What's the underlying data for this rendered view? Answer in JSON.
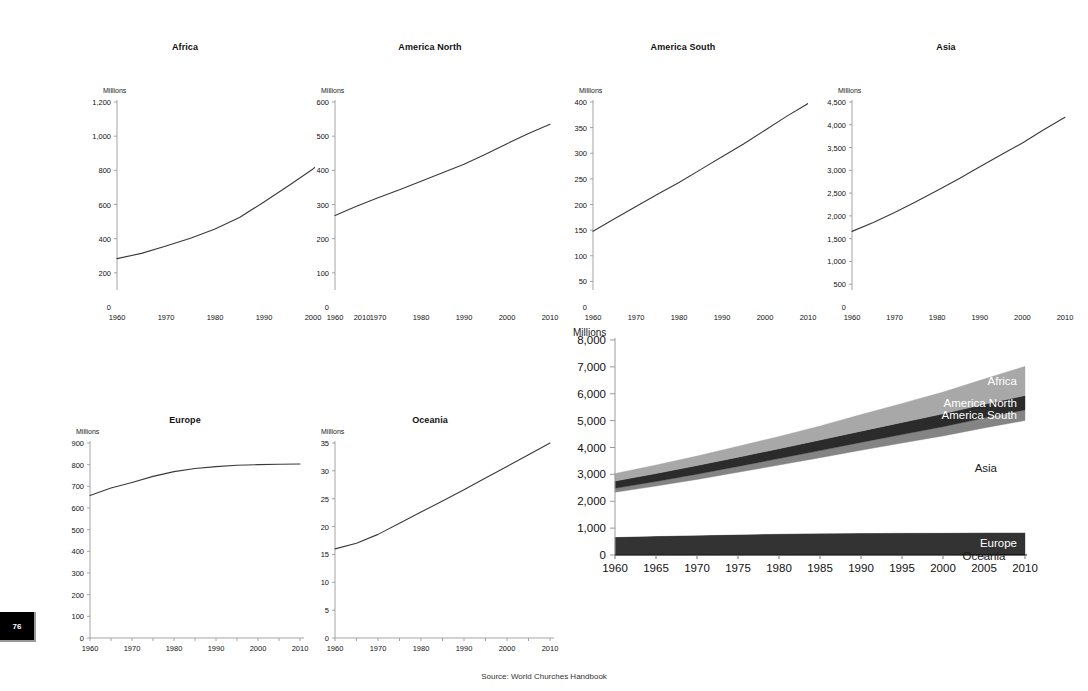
{
  "page_number": "76",
  "source_note": "Source: World Churches Handbook",
  "axis_unit_label": "Millions",
  "colors": {
    "line": "#3a3a3a",
    "axis": "#9a9a9a",
    "africa": "#a8a8a8",
    "america_north": "#2b2b2b",
    "america_south": "#848484",
    "asia": "#ffffff",
    "europe": "#333333",
    "oceania": "#1a1a1a",
    "text": "#1a1a1a"
  },
  "chart_data": [
    {
      "type": "line",
      "title": "Africa",
      "ylabel": "Millions",
      "xlabel": "",
      "x": [
        1960,
        1965,
        1970,
        1975,
        1980,
        1985,
        1990,
        1995,
        2000,
        2005,
        2010
      ],
      "values": [
        283,
        314,
        357,
        403,
        456,
        524,
        615,
        710,
        808,
        940,
        1085
      ],
      "ylim": [
        0,
        1200
      ],
      "yticks": [
        0,
        200,
        400,
        600,
        800,
        1000,
        1200
      ],
      "ytick_labels": [
        "0",
        "200",
        "400",
        "600",
        "800",
        "1,000",
        "1,200"
      ],
      "xlim": [
        1960,
        2010
      ],
      "xticks": [
        1960,
        1970,
        1980,
        1990,
        2000,
        2010
      ],
      "xtick_labels": [
        "1960",
        "1970",
        "1980",
        "1990",
        "2000",
        "2010"
      ],
      "xminor_step": 5,
      "grid": false
    },
    {
      "type": "line",
      "title": "America North",
      "ylabel": "Millions",
      "xlabel": "",
      "x": [
        1960,
        1965,
        1970,
        1975,
        1980,
        1985,
        1990,
        1995,
        2000,
        2005,
        2010
      ],
      "values": [
        268,
        295,
        320,
        343,
        368,
        393,
        418,
        447,
        478,
        508,
        535
      ],
      "ylim": [
        0,
        600
      ],
      "yticks": [
        0,
        100,
        200,
        300,
        400,
        500,
        600
      ],
      "ytick_labels": [
        "0",
        "100",
        "200",
        "300",
        "400",
        "500",
        "600"
      ],
      "xlim": [
        1960,
        2010
      ],
      "xticks": [
        1960,
        1970,
        1980,
        1990,
        2000,
        2010
      ],
      "xtick_labels": [
        "1960",
        "1970",
        "1980",
        "1990",
        "2000",
        "2010"
      ],
      "xminor_step": 5,
      "grid": false
    },
    {
      "type": "line",
      "title": "America South",
      "ylabel": "Millions",
      "xlabel": "",
      "x": [
        1960,
        1965,
        1970,
        1975,
        1980,
        1985,
        1990,
        1995,
        2000,
        2005,
        2010
      ],
      "values": [
        148,
        172,
        196,
        220,
        243,
        268,
        293,
        318,
        345,
        372,
        397
      ],
      "ylim": [
        0,
        400
      ],
      "yticks": [
        0,
        50,
        100,
        150,
        200,
        250,
        300,
        350,
        400
      ],
      "ytick_labels": [
        "0",
        "50",
        "100",
        "150",
        "200",
        "250",
        "300",
        "350",
        "400"
      ],
      "xlim": [
        1960,
        2010
      ],
      "xticks": [
        1960,
        1970,
        1980,
        1990,
        2000,
        2010
      ],
      "xtick_labels": [
        "1960",
        "1970",
        "1980",
        "1990",
        "2000",
        "2010"
      ],
      "xminor_step": 5,
      "grid": false
    },
    {
      "type": "line",
      "title": "Asia",
      "ylabel": "Millions",
      "xlabel": "",
      "x": [
        1960,
        1965,
        1970,
        1975,
        1980,
        1985,
        1990,
        1995,
        2000,
        2005,
        2010
      ],
      "values": [
        1660,
        1855,
        2075,
        2310,
        2555,
        2810,
        3080,
        3340,
        3600,
        3890,
        4165
      ],
      "ylim": [
        0,
        4500
      ],
      "yticks": [
        0,
        500,
        1000,
        1500,
        2000,
        2500,
        3000,
        3500,
        4000,
        4500
      ],
      "ytick_labels": [
        "0",
        "500",
        "1,000",
        "1,500",
        "2,000",
        "2,500",
        "3,000",
        "3,500",
        "4,000",
        "4,500"
      ],
      "xlim": [
        1960,
        2010
      ],
      "xticks": [
        1960,
        1970,
        1980,
        1990,
        2000,
        2010
      ],
      "xtick_labels": [
        "1960",
        "1970",
        "1980",
        "1990",
        "2000",
        "2010"
      ],
      "xminor_step": 5,
      "grid": false
    },
    {
      "type": "line",
      "title": "Europe",
      "ylabel": "Millions",
      "xlabel": "",
      "x": [
        1960,
        1965,
        1970,
        1975,
        1980,
        1985,
        1990,
        1995,
        2000,
        2005,
        2010
      ],
      "values": [
        658,
        692,
        718,
        746,
        768,
        782,
        791,
        797,
        800,
        802,
        803
      ],
      "ylim": [
        0,
        900
      ],
      "yticks": [
        0,
        100,
        200,
        300,
        400,
        500,
        600,
        700,
        800,
        900
      ],
      "ytick_labels": [
        "0",
        "100",
        "200",
        "300",
        "400",
        "500",
        "600",
        "700",
        "800",
        "900"
      ],
      "xlim": [
        1960,
        2010
      ],
      "xticks": [
        1960,
        1970,
        1980,
        1990,
        2000,
        2010
      ],
      "xtick_labels": [
        "1960",
        "1970",
        "1980",
        "1990",
        "2000",
        "2010"
      ],
      "xminor_step": 5,
      "grid": false
    },
    {
      "type": "line",
      "title": "Oceania",
      "ylabel": "Millions",
      "xlabel": "",
      "x": [
        1960,
        1965,
        1970,
        1975,
        1980,
        1985,
        1990,
        1995,
        2000,
        2005,
        2010
      ],
      "values": [
        16.0,
        17.0,
        18.6,
        20.6,
        22.6,
        24.6,
        26.6,
        28.7,
        30.8,
        32.9,
        35.0
      ],
      "ylim": [
        0,
        35
      ],
      "yticks": [
        0,
        5,
        10,
        15,
        20,
        25,
        30,
        35
      ],
      "ytick_labels": [
        "0",
        "5",
        "10",
        "15",
        "20",
        "25",
        "30",
        "35"
      ],
      "xlim": [
        1960,
        2010
      ],
      "xticks": [
        1960,
        1970,
        1980,
        1990,
        2000,
        2010
      ],
      "xtick_labels": [
        "1960",
        "1970",
        "1980",
        "1990",
        "2000",
        "2010"
      ],
      "xminor_step": 5,
      "grid": false
    },
    {
      "type": "area",
      "title": "",
      "stacked": true,
      "ylabel": "Millions",
      "xlabel": "",
      "x": [
        1960,
        1965,
        1970,
        1975,
        1980,
        1985,
        1990,
        1995,
        2000,
        2005,
        2010
      ],
      "ylim": [
        0,
        8000
      ],
      "yticks": [
        0,
        1000,
        2000,
        3000,
        4000,
        5000,
        6000,
        7000,
        8000
      ],
      "ytick_labels": [
        "0",
        "1,000",
        "2,000",
        "3,000",
        "4,000",
        "5,000",
        "6,000",
        "7,000",
        "8,000"
      ],
      "xlim": [
        1960,
        2010
      ],
      "xticks": [
        1960,
        1965,
        1970,
        1975,
        1980,
        1985,
        1990,
        1995,
        2000,
        2005,
        2010
      ],
      "xtick_labels": [
        "1960",
        "1965",
        "1970",
        "1975",
        "1980",
        "1985",
        "1990",
        "1995",
        "2000",
        "2005",
        "2010"
      ],
      "grid": false,
      "legend_position": "inline-right",
      "series": [
        {
          "name": "Oceania",
          "values": [
            16.0,
            17.0,
            18.6,
            20.6,
            22.6,
            24.6,
            26.6,
            28.7,
            30.8,
            32.9,
            35.0
          ],
          "color": "#1a1a1a",
          "label_style": "dark"
        },
        {
          "name": "Europe",
          "values": [
            658,
            692,
            718,
            746,
            768,
            782,
            791,
            797,
            800,
            802,
            803
          ],
          "color": "#333333",
          "label_style": "light"
        },
        {
          "name": "Asia",
          "values": [
            1660,
            1855,
            2075,
            2310,
            2555,
            2810,
            3080,
            3340,
            3600,
            3890,
            4165
          ],
          "color": "#ffffff",
          "label_style": "dark"
        },
        {
          "name": "America South",
          "values": [
            148,
            172,
            196,
            220,
            243,
            268,
            293,
            318,
            345,
            372,
            397
          ],
          "color": "#848484",
          "label_style": "light"
        },
        {
          "name": "America North",
          "values": [
            268,
            295,
            320,
            343,
            368,
            393,
            418,
            447,
            478,
            508,
            535
          ],
          "color": "#2b2b2b",
          "label_style": "light"
        },
        {
          "name": "Africa",
          "values": [
            283,
            314,
            357,
            403,
            456,
            524,
            615,
            710,
            808,
            940,
            1085
          ],
          "color": "#a8a8a8",
          "label_style": "light"
        }
      ]
    }
  ]
}
